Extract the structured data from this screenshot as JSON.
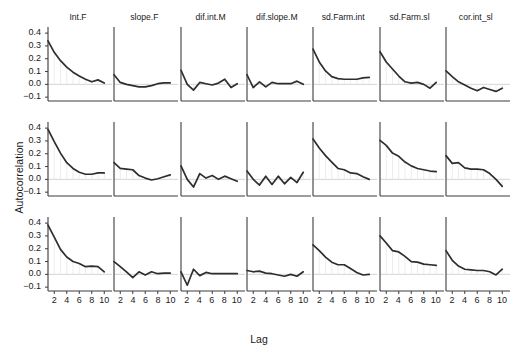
{
  "figure": {
    "ylabel": "Autocorrelation",
    "xlabel": "Lag",
    "curve_color": "#2e2e2e",
    "axis_color": "#3c3c3c",
    "zeroline_color": "#cfcfcf",
    "background_color": "#ffffff"
  },
  "axes": {
    "y_ticks": [
      "0.4",
      "0.3",
      "0.2",
      "0.1",
      "0.0",
      "-0.1"
    ],
    "y_tick_values": [
      0.4,
      0.3,
      0.2,
      0.1,
      0.0,
      -0.1
    ],
    "ylim": [
      -0.13,
      0.44
    ],
    "x_ticks": [
      "2",
      "4",
      "6",
      "8",
      "10"
    ],
    "x_tick_values": [
      2,
      4,
      6,
      8,
      10
    ],
    "xlim": [
      1,
      10.6
    ],
    "grid": false,
    "n_rows": 3,
    "n_cols": 7
  },
  "column_titles": [
    "Int.F",
    "slope.F",
    "dif.int.M",
    "dif.slope.M",
    "sd.Farm.int",
    "sd.Farm.sl",
    "cor.int_sl"
  ],
  "chart_data": {
    "type": "line",
    "title": "",
    "subtitle": "",
    "xlabel": "Lag",
    "ylabel": "Autocorrelation",
    "xlim": [
      1,
      10.6
    ],
    "ylim": [
      -0.13,
      0.44
    ],
    "x": [
      1,
      2,
      3,
      4,
      5,
      6,
      7,
      8,
      9,
      10
    ],
    "grid": false,
    "legend": "none",
    "panel_layout": "3 rows x 7 columns, shared axes",
    "annotations": [
      "zero reference line at y = 0.0 in every panel"
    ],
    "panels": [
      {
        "row": 1,
        "col": 1,
        "title": "Int.F",
        "values": [
          0.34,
          0.25,
          0.185,
          0.135,
          0.095,
          0.065,
          0.04,
          0.02,
          0.035,
          0.01
        ]
      },
      {
        "row": 1,
        "col": 2,
        "title": "slope.F",
        "values": [
          0.075,
          0.015,
          0.0,
          -0.01,
          -0.02,
          -0.02,
          -0.01,
          0.005,
          0.012,
          0.012
        ]
      },
      {
        "row": 1,
        "col": 3,
        "title": "dif.int.M",
        "values": [
          0.11,
          0.0,
          -0.045,
          0.015,
          0.005,
          -0.005,
          0.01,
          0.04,
          -0.025,
          0.005
        ]
      },
      {
        "row": 1,
        "col": 4,
        "title": "dif.slope.M",
        "values": [
          0.075,
          -0.025,
          0.02,
          -0.02,
          0.015,
          0.005,
          0.005,
          0.005,
          0.025,
          0.0
        ]
      },
      {
        "row": 1,
        "col": 5,
        "title": "sd.Farm.int",
        "values": [
          0.275,
          0.175,
          0.105,
          0.06,
          0.045,
          0.04,
          0.04,
          0.04,
          0.05,
          0.055
        ]
      },
      {
        "row": 1,
        "col": 6,
        "title": "sd.Farm.sl",
        "values": [
          0.255,
          0.175,
          0.12,
          0.065,
          0.02,
          0.01,
          0.015,
          0.0,
          -0.03,
          0.015
        ]
      },
      {
        "row": 1,
        "col": 7,
        "title": "cor.int_sl",
        "values": [
          0.105,
          0.06,
          0.02,
          -0.005,
          -0.03,
          -0.05,
          -0.025,
          -0.04,
          -0.055,
          -0.03
        ]
      },
      {
        "row": 2,
        "col": 1,
        "title": "Int.F",
        "values": [
          0.39,
          0.295,
          0.205,
          0.13,
          0.085,
          0.055,
          0.04,
          0.04,
          0.05,
          0.05
        ]
      },
      {
        "row": 2,
        "col": 2,
        "title": "slope.F",
        "values": [
          0.13,
          0.085,
          0.08,
          0.075,
          0.03,
          0.01,
          -0.005,
          0.005,
          0.02,
          0.035
        ]
      },
      {
        "row": 2,
        "col": 3,
        "title": "dif.int.M",
        "values": [
          0.105,
          0.0,
          -0.06,
          0.045,
          0.01,
          0.03,
          0.0,
          0.025,
          0.005,
          -0.015
        ]
      },
      {
        "row": 2,
        "col": 4,
        "title": "dif.slope.M",
        "values": [
          0.065,
          0.0,
          -0.045,
          0.025,
          -0.04,
          0.025,
          -0.035,
          0.015,
          -0.025,
          0.055
        ]
      },
      {
        "row": 2,
        "col": 5,
        "title": "sd.Farm.int",
        "values": [
          0.315,
          0.245,
          0.185,
          0.135,
          0.085,
          0.075,
          0.05,
          0.045,
          0.02,
          0.0
        ]
      },
      {
        "row": 2,
        "col": 6,
        "title": "sd.Farm.sl",
        "values": [
          0.305,
          0.265,
          0.205,
          0.18,
          0.135,
          0.105,
          0.085,
          0.075,
          0.065,
          0.06
        ]
      },
      {
        "row": 2,
        "col": 7,
        "title": "cor.int_sl",
        "values": [
          0.185,
          0.125,
          0.13,
          0.09,
          0.08,
          0.08,
          0.075,
          0.045,
          0.0,
          -0.055
        ]
      },
      {
        "row": 3,
        "col": 1,
        "title": "Int.F",
        "values": [
          0.385,
          0.29,
          0.195,
          0.135,
          0.1,
          0.085,
          0.06,
          0.065,
          0.06,
          0.02
        ]
      },
      {
        "row": 3,
        "col": 2,
        "title": "slope.F",
        "values": [
          0.1,
          0.06,
          0.02,
          -0.025,
          0.02,
          -0.005,
          0.02,
          0.005,
          0.01,
          0.01
        ]
      },
      {
        "row": 3,
        "col": 3,
        "title": "dif.int.M",
        "values": [
          0.02,
          -0.085,
          0.04,
          -0.01,
          0.015,
          0.005,
          0.005,
          0.005,
          0.005,
          0.005
        ]
      },
      {
        "row": 3,
        "col": 4,
        "title": "dif.slope.M",
        "values": [
          0.03,
          0.02,
          0.025,
          0.01,
          0.005,
          -0.005,
          -0.015,
          0.0,
          -0.015,
          0.02
        ]
      },
      {
        "row": 3,
        "col": 5,
        "title": "sd.Farm.int",
        "values": [
          0.23,
          0.185,
          0.135,
          0.095,
          0.075,
          0.075,
          0.045,
          0.015,
          -0.005,
          0.0
        ]
      },
      {
        "row": 3,
        "col": 6,
        "title": "sd.Farm.sl",
        "values": [
          0.3,
          0.245,
          0.185,
          0.175,
          0.14,
          0.1,
          0.095,
          0.08,
          0.075,
          0.07
        ]
      },
      {
        "row": 3,
        "col": 7,
        "title": "cor.int_sl",
        "values": [
          0.185,
          0.11,
          0.065,
          0.04,
          0.035,
          0.03,
          0.03,
          0.02,
          -0.005,
          0.04
        ]
      }
    ]
  }
}
